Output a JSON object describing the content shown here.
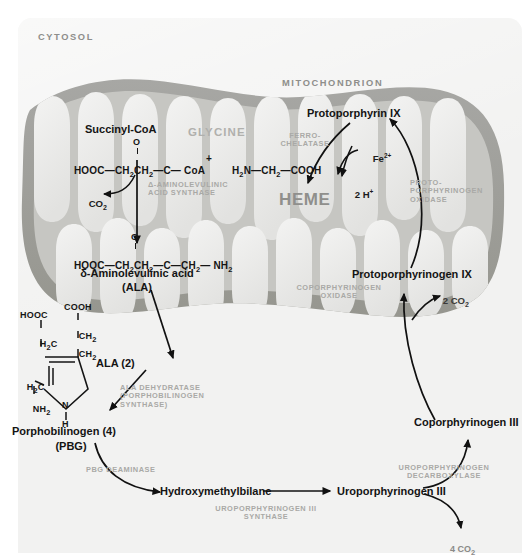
{
  "diagram": {
    "compartments": {
      "cytosol_label": "CYTOSOL",
      "mitochondrion_label": "MITOCHONDRION"
    },
    "colors": {
      "page_bg": "#f2f2f1",
      "mito_outer": "#9d9d9a",
      "mito_matrix": "#c9c9c5",
      "cristae": "#ececeb",
      "text_dark": "#141414",
      "enzyme_gray": "#a9a9a6",
      "zone_gray": "#8e8e8b"
    }
  },
  "metabolites": {
    "succinyl_coa": "Succinyl-CoA",
    "glycine": "GLYCINE",
    "succinyl_coa_formula_left": "HOOC",
    "succinyl_coa_formula": "HOOC—CH2CH2—C— CoA",
    "plus": "+",
    "glycine_formula": "H2N—CH2—COOH",
    "carbonyl_o": "O",
    "co2": "CO2",
    "ala_formula": "HOOC—CH2CH2—C—CH2— NH2",
    "ala_name_line1": "δ-Aminolevulinic acid",
    "ala_name_line2": "(ALA)",
    "ala_two": "ALA (2)",
    "pbg_name_line1": "Porphobilinogen (4)",
    "pbg_name_line2": "(PBG)",
    "hydroxymethylbilane": "Hydroxymethylbilane",
    "uroporphyrinogen_iii": "Uroporphyrinogen III",
    "coproporphyrinogen_iii": "Coporphyrinogen III",
    "protoporphyrinogen_ix": "Protoporphyrinogen IX",
    "protoporphyrin_ix": "Protoporphyrin IX",
    "heme": "HEME",
    "iron": "Fe2+",
    "two_h": "2 H+",
    "two_co2": "2 CO2",
    "four_co2": "4 CO2"
  },
  "pbg_structure": {
    "cooh_top": "COOH",
    "ch2_a": "CH2",
    "ch2_b": "CH2",
    "hooc_left": "HOOC",
    "h2c_left": "H2C",
    "h2c_lower": "H2C",
    "nh2": "NH2",
    "ring_n": "N",
    "ring_nh": "H"
  },
  "enzymes": {
    "ala_synthase": "δ-AMINOLEVULINIC\nACID SYNTHASE",
    "ala_dehydratase": "ALA DEHYDRATASE\n(PORPHOBILINOGEN\nSYNTHASE)",
    "pbg_deaminase": "PBG DEAMINASE",
    "uro_iii_synthase": "UROPORPHYRINOGEN III\nSYNTHASE",
    "uro_decarboxylase": "UROPORPHYRINOGEN\nDECARBOXYLASE",
    "copro_oxidase": "COPORPHYRINOGEN\nOXIDASE",
    "proto_oxidase": "PROTO-\nPORPHYRINOGEN\nOXIDASE",
    "ferrochelatase": "FERRO-\nCHELATASE"
  }
}
